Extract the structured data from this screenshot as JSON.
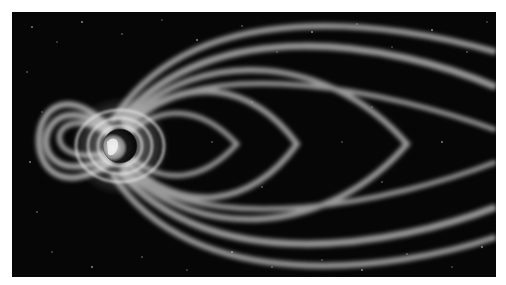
{
  "image": {
    "subject": "Earth's magnetosphere field lines against a starfield",
    "style": "grayscale illustration",
    "background_color": "#060606",
    "field_color": "#d8d8d8",
    "border_color": "#ffffff"
  }
}
